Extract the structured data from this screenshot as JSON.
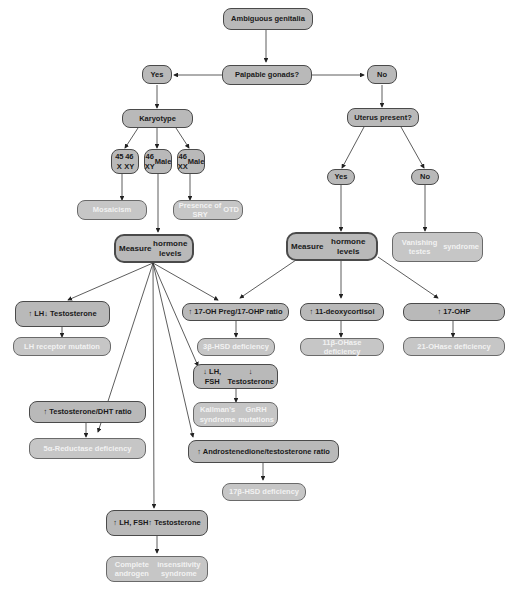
{
  "diagram": {
    "title": "Ambiguous genitalia",
    "nodes": {
      "root": {
        "lines": [
          "Ambiguous genitalia"
        ]
      },
      "palpable": {
        "lines": [
          "Palpable gonads?"
        ]
      },
      "yes1": {
        "lines": [
          "Yes"
        ]
      },
      "no1": {
        "lines": [
          "No"
        ]
      },
      "karyotype": {
        "lines": [
          "Karyotype"
        ]
      },
      "k45": {
        "lines": [
          "45 X",
          "46 XY"
        ]
      },
      "k46xy": {
        "lines": [
          "46 XY",
          "Male"
        ]
      },
      "k46xx": {
        "lines": [
          "46 XX",
          "Male"
        ]
      },
      "mosaicism": {
        "lines": [
          "Mosaicism"
        ]
      },
      "sry": {
        "lines": [
          "Presence of SRY",
          "OTD"
        ]
      },
      "measureL": {
        "lines": [
          "Measure",
          "hormone levels"
        ]
      },
      "uterus": {
        "lines": [
          "Uterus present?"
        ]
      },
      "yes2": {
        "lines": [
          "Yes"
        ]
      },
      "no2": {
        "lines": [
          "No"
        ]
      },
      "measureR": {
        "lines": [
          "Measure",
          "hormone levels"
        ]
      },
      "vanishing": {
        "lines": [
          "Vanishing testes",
          "syndrome"
        ]
      },
      "lhT": {
        "lines": [
          "↑ LH",
          "↓ Testosterone"
        ]
      },
      "lhrec": {
        "lines": [
          "LH receptor mutation"
        ]
      },
      "ohpreg": {
        "lines": [
          "↑ 17-OH Preg/17-OHP ratio"
        ]
      },
      "hsd3": {
        "lines": [
          "3β-HSD deficiency"
        ]
      },
      "deoxy": {
        "lines": [
          "↑ 11-deoxycortisol"
        ]
      },
      "oh11": {
        "lines": [
          "11β-OHase deficiency"
        ]
      },
      "ohp17": {
        "lines": [
          "↑ 17-OHP"
        ]
      },
      "oh21": {
        "lines": [
          "21-OHase deficiency"
        ]
      },
      "lhfshLow": {
        "lines": [
          "↓ LH, FSH",
          "↓ Testosterone"
        ]
      },
      "kallman": {
        "lines": [
          "Kallman's syndrome",
          "GnRH mutations"
        ]
      },
      "tdht": {
        "lines": [
          "↑ Testosterone/DHT ratio"
        ]
      },
      "red5": {
        "lines": [
          "5α-Reductase deficiency"
        ]
      },
      "andro": {
        "lines": [
          "↑ Androstenedione/testosterone ratio"
        ]
      },
      "hsd17": {
        "lines": [
          "17β-HSD deficiency"
        ]
      },
      "lhfshHigh": {
        "lines": [
          "↑ LH, FSH",
          "↑ Testosterone"
        ]
      },
      "cais": {
        "lines": [
          "Complete androgen",
          "insensitivity syndrome"
        ]
      }
    },
    "colors": {
      "node_fill": "#b9b9b9",
      "result_fill": "#c6c6c6",
      "border": "#4a4a4a",
      "line": "#333333"
    }
  }
}
